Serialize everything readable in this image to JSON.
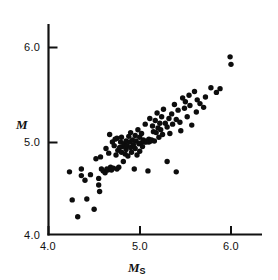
{
  "chart_data": {
    "type": "scatter",
    "title": "",
    "subtitle": "",
    "xlabel": "M_S",
    "xlabel_base": "M",
    "xlabel_sub": "S",
    "ylabel": "M",
    "ylabel_base": "M",
    "ylabel_sub": "",
    "xlim": [
      3.92,
      6.34
    ],
    "ylim": [
      3.98,
      6.26
    ],
    "xticks": [
      4.0,
      5.0,
      6.0
    ],
    "xticklabels": [
      "4.0",
      "5.0",
      "6.0"
    ],
    "yticks": [
      4.0,
      5.0,
      6.0
    ],
    "yticklabels": [
      "4.0",
      "5.0",
      "6.0"
    ],
    "grid": false,
    "legend": null,
    "marker": "filled-circle",
    "marker_color": "#0d0d0d",
    "marker_size_px": 5.4,
    "axis_color": "#111111",
    "background_color": "#ffffff",
    "n_points": 118,
    "series": [
      {
        "name": "earthquakes",
        "points": [
          [
            4.23,
            4.67
          ],
          [
            4.26,
            4.37
          ],
          [
            4.32,
            4.19
          ],
          [
            4.36,
            4.63
          ],
          [
            4.36,
            4.7
          ],
          [
            4.4,
            4.58
          ],
          [
            4.42,
            4.38
          ],
          [
            4.46,
            4.64
          ],
          [
            4.5,
            4.27
          ],
          [
            4.52,
            4.81
          ],
          [
            4.55,
            4.53
          ],
          [
            4.55,
            4.6
          ],
          [
            4.56,
            4.46
          ],
          [
            4.57,
            4.83
          ],
          [
            4.58,
            4.7
          ],
          [
            4.6,
            4.68
          ],
          [
            4.62,
            4.66
          ],
          [
            4.63,
            4.92
          ],
          [
            4.64,
            4.7
          ],
          [
            4.65,
            4.69
          ],
          [
            4.66,
            4.87
          ],
          [
            4.67,
            5.07
          ],
          [
            4.68,
            4.72
          ],
          [
            4.69,
            4.69
          ],
          [
            4.7,
            4.99
          ],
          [
            4.71,
            4.71
          ],
          [
            4.72,
            4.95
          ],
          [
            4.73,
            5.02
          ],
          [
            4.74,
            4.85
          ],
          [
            4.75,
            4.7
          ],
          [
            4.75,
            5.03
          ],
          [
            4.76,
            4.9
          ],
          [
            4.77,
            4.72
          ],
          [
            4.78,
            4.93
          ],
          [
            4.79,
            4.99
          ],
          [
            4.8,
            4.88
          ],
          [
            4.8,
            5.04
          ],
          [
            4.81,
            4.94
          ],
          [
            4.82,
            4.78
          ],
          [
            4.83,
            4.97
          ],
          [
            4.84,
            4.86
          ],
          [
            4.85,
            5.0
          ],
          [
            4.85,
            4.91
          ],
          [
            4.86,
            4.95
          ],
          [
            4.87,
            4.84
          ],
          [
            4.88,
            5.05
          ],
          [
            4.89,
            4.99
          ],
          [
            4.9,
            4.93
          ],
          [
            4.9,
            5.09
          ],
          [
            4.91,
            4.88
          ],
          [
            4.92,
            5.01
          ],
          [
            4.93,
            4.96
          ],
          [
            4.94,
            4.7
          ],
          [
            4.95,
            5.06
          ],
          [
            4.95,
            4.92
          ],
          [
            4.96,
            5.0
          ],
          [
            4.97,
            4.85
          ],
          [
            4.98,
            5.12
          ],
          [
            4.99,
            4.97
          ],
          [
            5.0,
            5.04
          ],
          [
            5.0,
            4.89
          ],
          [
            5.01,
            4.98
          ],
          [
            5.02,
            5.08
          ],
          [
            5.03,
            4.94
          ],
          [
            5.04,
            5.01
          ],
          [
            5.05,
            4.99
          ],
          [
            5.06,
            5.18
          ],
          [
            5.07,
            4.99
          ],
          [
            5.08,
            5.0
          ],
          [
            5.09,
            4.68
          ],
          [
            5.1,
            5.02
          ],
          [
            5.1,
            4.99
          ],
          [
            5.11,
            5.24
          ],
          [
            5.12,
            5.0
          ],
          [
            5.13,
            5.01
          ],
          [
            5.14,
            5.16
          ],
          [
            5.15,
            5.1
          ],
          [
            5.16,
            5.0
          ],
          [
            5.17,
            5.22
          ],
          [
            5.18,
            5.09
          ],
          [
            5.19,
            5.3
          ],
          [
            5.2,
            5.14
          ],
          [
            5.21,
            5.04
          ],
          [
            5.22,
            5.19
          ],
          [
            5.23,
            5.12
          ],
          [
            5.24,
            5.26
          ],
          [
            5.25,
            5.07
          ],
          [
            5.26,
            5.34
          ],
          [
            5.28,
            5.19
          ],
          [
            5.3,
            5.15
          ],
          [
            5.3,
            4.78
          ],
          [
            5.32,
            5.24
          ],
          [
            5.33,
            5.08
          ],
          [
            5.35,
            5.29
          ],
          [
            5.36,
            5.18
          ],
          [
            5.38,
            5.39
          ],
          [
            5.4,
            5.23
          ],
          [
            5.4,
            4.67
          ],
          [
            5.42,
            5.33
          ],
          [
            5.44,
            5.2
          ],
          [
            5.45,
            5.11
          ],
          [
            5.47,
            5.46
          ],
          [
            5.49,
            5.35
          ],
          [
            5.5,
            5.42
          ],
          [
            5.52,
            5.26
          ],
          [
            5.54,
            5.49
          ],
          [
            5.55,
            5.38
          ],
          [
            5.57,
            5.17
          ],
          [
            5.6,
            5.53
          ],
          [
            5.62,
            5.31
          ],
          [
            5.63,
            5.44
          ],
          [
            5.66,
            5.4
          ],
          [
            5.7,
            5.36
          ],
          [
            5.72,
            5.47
          ],
          [
            5.78,
            5.57
          ],
          [
            5.84,
            5.52
          ],
          [
            5.88,
            5.56
          ],
          [
            5.99,
            5.9
          ],
          [
            6.0,
            5.82
          ]
        ]
      }
    ]
  },
  "axes": {
    "y_ticks": [
      {
        "value": 6.0,
        "label": "6.0"
      },
      {
        "value": 5.0,
        "label": "5.0"
      },
      {
        "value": 4.0,
        "label": "4.0"
      }
    ],
    "x_ticks": [
      {
        "value": 4.0,
        "label": "4.0"
      },
      {
        "value": 5.0,
        "label": "5.0"
      },
      {
        "value": 6.0,
        "label": "6.0"
      }
    ]
  }
}
